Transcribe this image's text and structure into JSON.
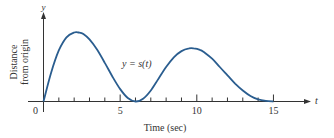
{
  "chart_data": {
    "type": "line",
    "title": "",
    "xlabel": "Time (sec)",
    "ylabel": "Distance from origin",
    "ylabel_lines": [
      "Distance",
      "from origin"
    ],
    "x_axis_var": "t",
    "y_axis_var": "y",
    "curve_label": "y = s(t)",
    "x_ticks": [
      0,
      1,
      2,
      3,
      4,
      5,
      6,
      7,
      8,
      9,
      10,
      11,
      12,
      13,
      14,
      15
    ],
    "x_tick_labels": [
      "0",
      "5",
      "10",
      "15"
    ],
    "xlim": [
      0,
      15
    ],
    "ylim": [
      0,
      1
    ],
    "grid": false,
    "legend": "none",
    "series": [
      {
        "name": "s(t)",
        "color": "#2a5d8f",
        "x": [
          0,
          0.5,
          1,
          1.5,
          2,
          2.3,
          2.6,
          3,
          3.5,
          4,
          4.5,
          5,
          5.5,
          6,
          6.5,
          7,
          7.5,
          8,
          8.5,
          9,
          9.5,
          9.8,
          10.2,
          10.5,
          11,
          11.5,
          12,
          12.5,
          13,
          13.5,
          14,
          14.5,
          15
        ],
        "values": [
          0,
          0.42,
          0.74,
          0.93,
          1.0,
          1.0,
          0.98,
          0.9,
          0.75,
          0.56,
          0.36,
          0.18,
          0.05,
          0.0,
          0.04,
          0.16,
          0.33,
          0.5,
          0.64,
          0.73,
          0.77,
          0.77,
          0.75,
          0.71,
          0.62,
          0.5,
          0.38,
          0.26,
          0.16,
          0.08,
          0.03,
          0.01,
          0.0
        ]
      }
    ]
  }
}
